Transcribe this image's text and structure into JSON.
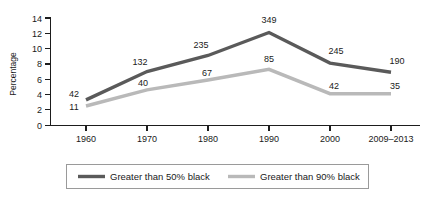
{
  "chart_data": {
    "type": "line",
    "title": "",
    "xlabel": "",
    "ylabel": "Percentage",
    "categories": [
      "1960",
      "1970",
      "1980",
      "1990",
      "2000",
      "2009–2013"
    ],
    "ylim": [
      0,
      14
    ],
    "yticks": [
      0,
      2,
      4,
      6,
      8,
      10,
      12,
      14
    ],
    "ytick_labels": [
      "0",
      "2",
      "4",
      "6",
      "8",
      "10",
      "12",
      "14"
    ],
    "grid": false,
    "legend_position": "bottom",
    "series": [
      {
        "name": "Greater than 50% black",
        "color": "#5a5a5a",
        "values": [
          3.3,
          7.0,
          9.1,
          12.1,
          8.1,
          6.9
        ],
        "point_labels": [
          "42",
          "132",
          "235",
          "349",
          "245",
          "190"
        ]
      },
      {
        "name": "Greater than 90% black",
        "color": "#b9b9b9",
        "values": [
          2.5,
          4.6,
          5.9,
          7.3,
          4.1,
          4.1
        ],
        "point_labels": [
          "11",
          "40",
          "67",
          "85",
          "42",
          "35"
        ]
      }
    ]
  },
  "legend": {
    "entries": [
      {
        "label": "Greater than 50% black",
        "color": "#5a5a5a"
      },
      {
        "label": "Greater than 90% black",
        "color": "#b9b9b9"
      }
    ]
  },
  "labels": {
    "s0_1960": "42",
    "s0_1970": "132",
    "s0_1980": "235",
    "s0_1990": "349",
    "s0_2000": "245",
    "s0_2013": "190",
    "s1_1960": "11",
    "s1_1970": "40",
    "s1_1980": "67",
    "s1_1990": "85",
    "s1_2000": "42",
    "s1_2013": "35"
  },
  "yticks": {
    "t0": "0",
    "t2": "2",
    "t4": "4",
    "t6": "6",
    "t8": "8",
    "t10": "10",
    "t12": "12",
    "t14": "14"
  },
  "xticks": {
    "x1960": "1960",
    "x1970": "1970",
    "x1980": "1980",
    "x1990": "1990",
    "x2000": "2000",
    "x2013": "2009–2013"
  },
  "axis": {
    "y_title": "Percentage"
  }
}
